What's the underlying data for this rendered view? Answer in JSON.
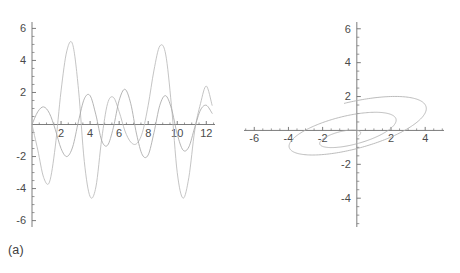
{
  "figure": {
    "panels": [
      {
        "id": "a",
        "caption": "(a)"
      },
      {
        "id": "b",
        "caption": "(b)"
      }
    ]
  },
  "chart_data": [
    {
      "type": "line",
      "panel": "(a)",
      "title": "",
      "subtitle": "",
      "xlabel": "",
      "ylabel": "",
      "xlim": [
        0,
        12.6
      ],
      "ylim": [
        -6.4,
        6.4
      ],
      "xticks": [
        2,
        4,
        6,
        8,
        10,
        12
      ],
      "xtick_labels": [
        "2",
        "4",
        "6",
        "8",
        "10",
        "12"
      ],
      "yticks": [
        -6,
        -4,
        -2,
        2,
        4,
        6
      ],
      "ytick_labels": [
        "-6",
        "-4",
        "-2",
        "2",
        "4",
        "6"
      ],
      "minor_ticks": true,
      "grid": false,
      "legend": "none",
      "axis_color": "#6e6e6e",
      "series": [
        {
          "name": "large-amplitude-response",
          "color": "#b9b9b9",
          "description": "Beating oscillation, amplitude envelope peaking near t=2.7 and t=8.9 at y=5.0",
          "model": "beat: A(t)*sin(w t + p)",
          "amplitude_envelope_max": 5.0,
          "amplitude_envelope_min": 0.4,
          "period": 1.95,
          "beat_period": 6.2,
          "samples_x": [
            0,
            0.4,
            0.8,
            1.2,
            1.6,
            2.0,
            2.4,
            2.8,
            3.2,
            3.6,
            4.0,
            4.4,
            4.8,
            5.2,
            5.6,
            6.0,
            6.4,
            6.8,
            7.2,
            7.6,
            8.0,
            8.4,
            8.8,
            9.2,
            9.6,
            10.0,
            10.4,
            10.8,
            11.2,
            11.6,
            12.0,
            12.4
          ],
          "samples_y": [
            0.0,
            -1.6,
            -3.3,
            -3.6,
            -1.4,
            2.1,
            4.6,
            5.0,
            2.2,
            -2.3,
            -4.5,
            -3.9,
            -0.9,
            1.3,
            1.7,
            0.8,
            -0.4,
            -1.1,
            -1.2,
            -0.5,
            1.2,
            3.4,
            4.9,
            4.4,
            1.2,
            -3.0,
            -4.6,
            -3.3,
            -0.4,
            1.3,
            2.4,
            1.2
          ]
        },
        {
          "name": "small-amplitude-response",
          "color": "#a8a8a8",
          "description": "Lower-amplitude oscillation, amplitude about 1.2 to 2.5, slower period",
          "model": "beat: B(t)*sin(w2 t + p2)",
          "amplitude_envelope_max": 2.5,
          "amplitude_envelope_min": 1.1,
          "period": 2.55,
          "samples_x": [
            0,
            0.4,
            0.8,
            1.2,
            1.6,
            2.0,
            2.4,
            2.8,
            3.2,
            3.6,
            4.0,
            4.4,
            4.8,
            5.2,
            5.6,
            6.0,
            6.4,
            6.8,
            7.2,
            7.6,
            8.0,
            8.4,
            8.8,
            9.2,
            9.6,
            10.0,
            10.4,
            10.8,
            11.2,
            11.6,
            12.0,
            12.4
          ],
          "samples_y": [
            0.0,
            0.8,
            1.1,
            0.7,
            -0.3,
            -1.5,
            -2.0,
            -1.4,
            0.2,
            1.6,
            1.8,
            0.6,
            -1.0,
            -1.3,
            -0.2,
            1.5,
            2.2,
            1.3,
            -0.6,
            -1.9,
            -1.9,
            -0.5,
            1.2,
            1.8,
            1.0,
            -0.6,
            -1.6,
            -1.4,
            -0.2,
            0.9,
            1.2,
            0.7
          ]
        }
      ]
    },
    {
      "type": "line",
      "panel": "(b)",
      "title": "",
      "subtitle": "",
      "xlabel": "",
      "ylabel": "",
      "xlim": [
        -6.6,
        5.1
      ],
      "ylim": [
        -5.7,
        6.4
      ],
      "xticks": [
        -6,
        -4,
        -2,
        2,
        4
      ],
      "xtick_labels": [
        "-6",
        "-4",
        "-2",
        "2",
        "4"
      ],
      "yticks": [
        -4,
        -2,
        2,
        4,
        6
      ],
      "ytick_labels": [
        "-4",
        "-2",
        "2",
        "4",
        "6"
      ],
      "minor_ticks": true,
      "grid": false,
      "legend": "none",
      "axis_color": "#6e6e6e",
      "series": [
        {
          "name": "phase-portrait-orbit",
          "color": "#b0b0b0",
          "description": "Tilted elliptical spiral trajectory; outer loop reaching (-1.5, 5.1) top and (0.5, -4.8) bottom, inner loop reaching (-1.0, 2.6) and (-0.4, -3.6)",
          "outer_loop": {
            "center": [
              -0.35,
              0.2
            ],
            "semi_major": 5.0,
            "semi_minor": 1.45,
            "tilt_deg": 105
          },
          "inner_loop": {
            "center": [
              -0.45,
              -0.45
            ],
            "semi_major": 3.1,
            "semi_minor": 0.95,
            "tilt_deg": 104
          },
          "start_point": [
            0.0,
            0.0
          ],
          "end_point": [
            -0.15,
            1.6
          ]
        }
      ]
    }
  ]
}
